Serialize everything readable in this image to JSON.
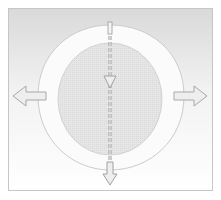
{
  "diagram": {
    "colors": {
      "frame_border": "#c8c8c8",
      "background_top": "#dedede",
      "background_bottom": "#ffffff",
      "ring_fill": "#fbfbfb",
      "ring_stroke": "#cfcfcf",
      "inner_circle_fill": "#e4e4e4",
      "inner_circle_stroke": "#d4d4d4",
      "arrow_fill": "#eeeeee",
      "arrow_stroke": "#a8a8a8",
      "dashed_line": "#9a9a9a"
    },
    "arrows": [
      {
        "name": "left-arrow",
        "direction": "left"
      },
      {
        "name": "right-arrow",
        "direction": "right"
      },
      {
        "name": "center-down-arrow",
        "direction": "down"
      },
      {
        "name": "bottom-down-arrow",
        "direction": "down"
      }
    ]
  }
}
